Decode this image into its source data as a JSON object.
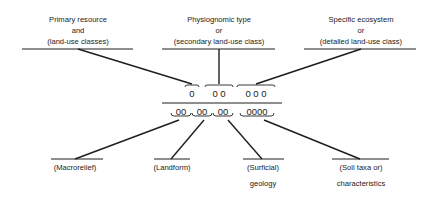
{
  "diagram": {
    "type": "hierarchical code structure",
    "top_labels": [
      {
        "lines": [
          "Primary resource",
          "and",
          "(land-use classes)"
        ]
      },
      {
        "lines": [
          "Physiognomic type",
          "or",
          "(secondary land-use class)"
        ]
      },
      {
        "lines": [
          "Specific ecosystem",
          "or",
          "(detailed land-use class)"
        ]
      }
    ],
    "upper_code_groups": [
      "0",
      "0 0",
      "0 0 0"
    ],
    "lower_code_groups": [
      "00",
      "00",
      "00",
      "0000"
    ],
    "bottom_labels": [
      {
        "lines": [
          "(Macrorelief)"
        ]
      },
      {
        "lines": [
          "(Landform)"
        ]
      },
      {
        "lines": [
          "(Surficial)",
          "geology"
        ]
      },
      {
        "lines": [
          "(Soil taxa or)",
          "characteristics"
        ]
      }
    ]
  }
}
